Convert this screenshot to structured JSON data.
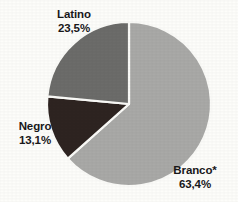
{
  "chart_data": {
    "type": "pie",
    "title": "",
    "subtitle": "",
    "xlabel": "",
    "ylabel": "",
    "legend_position": "none",
    "grid": false,
    "decimal_separator": ",",
    "value_suffix": "%",
    "start_angle_deg": 0,
    "direction": "clockwise",
    "categories": [
      "Branco*",
      "Latino",
      "Negro"
    ],
    "values": [
      63.4,
      23.5,
      13.1
    ],
    "labels": [
      "63,4%",
      "23,5%",
      "13,1%"
    ],
    "colors": [
      "#a9a9a7",
      "#6c6c6a",
      "#2e2421"
    ],
    "slices": [
      {
        "name": "Branco*",
        "value": 63.4,
        "value_label": "63,4%",
        "color": "#a9a9a7",
        "start_deg": 0,
        "end_deg": 228.24
      },
      {
        "name": "Latino",
        "value": 23.5,
        "value_label": "23,5%",
        "color": "#6c6c6a",
        "start_deg": 312.36,
        "end_deg": 360
      },
      {
        "name": "Negro",
        "value": 13.1,
        "value_label": "13,1%",
        "color": "#2e2421",
        "start_deg": 228.24,
        "end_deg": 275.4
      }
    ]
  },
  "figure": {
    "background_color": "#fdfdfa",
    "separator_color": "#fbfbf8",
    "text_color": "#19181a",
    "center_x": 129,
    "center_y": 104,
    "radius": 82
  },
  "labels": {
    "latino": {
      "name": "Latino",
      "value": "23,5%"
    },
    "negro": {
      "name": "Negro",
      "value": "13,1%"
    },
    "branco": {
      "name": "Branco*",
      "value": "63,4%"
    }
  }
}
